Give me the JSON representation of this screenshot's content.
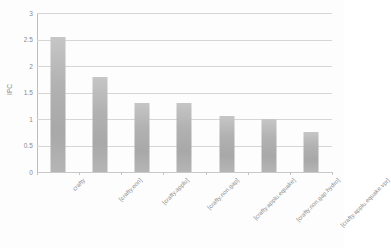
{
  "chart_data": {
    "type": "bar",
    "title": "",
    "xlabel": "",
    "ylabel": "IPC",
    "ylim": [
      0,
      3
    ],
    "ytick_labels": [
      "3",
      "2.5",
      "2",
      "1.5",
      "1",
      "0.5",
      "0"
    ],
    "ytick_values": [
      3,
      2.5,
      2,
      1.5,
      1,
      0.5,
      0
    ],
    "grid": true,
    "legend": "none",
    "categories": [
      "crafty",
      "[crafty.eon]",
      "[crafty.applu]",
      "[crafty.non.gap]",
      "[crafty.applu.equake]",
      "[crafty.non.gap.hydro]",
      "[crafty.applu.equake.vpr]"
    ],
    "values": [
      2.55,
      1.79,
      1.31,
      1.31,
      1.06,
      1.0,
      0.76
    ],
    "bar_color": "#b2b2b2",
    "gridline_color": "#d6d6d6",
    "axis_color": "#bdbdbd",
    "text_color": "#8a8a8a"
  }
}
